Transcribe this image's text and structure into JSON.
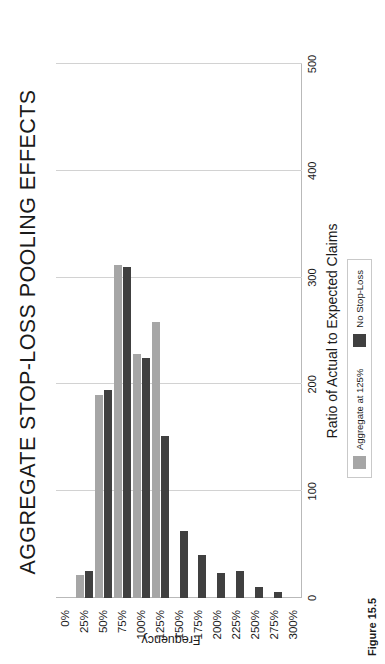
{
  "chart_data": {
    "type": "bar",
    "title": "AGGREGATE STOP-LOSS POOLING EFFECTS",
    "orientation": "vertical-rendered-rotated",
    "xlabel": "Ratio of Actual to Expected Claims",
    "ylabel": "Frequency",
    "categories": [
      "0%",
      "25%",
      "50%",
      "75%",
      "100%",
      "125%",
      "150%",
      "175%",
      "200%",
      "225%",
      "250%",
      "275%",
      "300%"
    ],
    "ylim": [
      0,
      500
    ],
    "yticks": [
      0,
      100,
      200,
      300,
      400,
      500
    ],
    "grid": true,
    "legend_position": "bottom-center",
    "series": [
      {
        "name": "Aggregate at 125%",
        "color": "#a6a6a6",
        "values": [
          0,
          22,
          190,
          312,
          228,
          258,
          0,
          0,
          0,
          0,
          0,
          0,
          0
        ]
      },
      {
        "name": "No Stop-Loss",
        "color": "#404040",
        "values": [
          0,
          25,
          195,
          310,
          225,
          152,
          63,
          40,
          23,
          25,
          10,
          6,
          0
        ]
      }
    ]
  },
  "chart": {
    "title": "AGGREGATE STOP-LOSS POOLING EFFECTS",
    "axis_title_x": "Ratio of Actual to Expected Claims",
    "axis_title_y": "Frequency",
    "ytick_labels": [
      "0",
      "100",
      "200",
      "300",
      "400",
      "500"
    ],
    "xtick_labels": [
      "0%",
      "25%",
      "50%",
      "75%",
      "100%",
      "125%",
      "150%",
      "175%",
      "200%",
      "225%",
      "250%",
      "275%",
      "300%"
    ],
    "legend": {
      "items": [
        {
          "label": "Aggregate at 125%",
          "color": "#a6a6a6",
          "swatch": "series-swatch-gray"
        },
        {
          "label": "No Stop-Loss",
          "color": "#404040",
          "swatch": "series-swatch-dark"
        }
      ]
    },
    "colors": {
      "series_aggregate": "#a6a6a6",
      "series_no_stop_loss": "#404040",
      "gridline": "#d2d2d2",
      "axis": "#b9b9b9",
      "background": "#ffffff",
      "text": "#1a1a1a"
    }
  },
  "caption": "Figure 15.5"
}
